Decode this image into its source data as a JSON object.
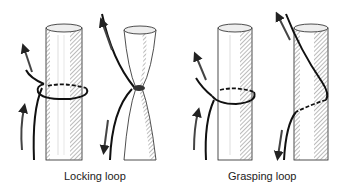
{
  "diagram": {
    "panels": [
      {
        "label": "Locking loop",
        "stages": [
          "loose loop around post",
          "tightened loop pinching post"
        ],
        "arrows": [
          "up",
          "up",
          "up",
          "down"
        ]
      },
      {
        "label": "Grasping loop",
        "stages": [
          "loose loop around post",
          "spiral grip around post"
        ],
        "arrows": [
          "up",
          "up",
          "up",
          "down"
        ]
      }
    ],
    "colors": {
      "line": "#111111",
      "hatch": "#888888",
      "background": "#ffffff"
    }
  }
}
